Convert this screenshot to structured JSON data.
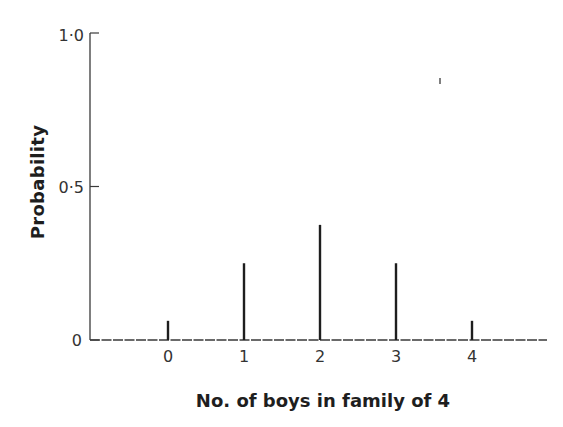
{
  "chart_data": {
    "type": "bar",
    "style": "stem",
    "title": "",
    "xlabel": "No. of boys in family of 4",
    "ylabel": "Probability",
    "categories": [
      "0",
      "1",
      "2",
      "3",
      "4"
    ],
    "values": [
      0.0625,
      0.25,
      0.375,
      0.25,
      0.0625
    ],
    "ylim": [
      0,
      1.0
    ],
    "yticks": [
      0,
      0.5,
      1.0
    ],
    "ytick_labels": [
      "0",
      "0·5",
      "1·0"
    ],
    "xtick_labels": [
      "0",
      "1",
      "2",
      "3",
      "4"
    ],
    "grid": false,
    "legend": null
  },
  "colors": {
    "ink": "#1e1e1e",
    "axis": "#3a3a3a",
    "background": "#ffffff"
  }
}
